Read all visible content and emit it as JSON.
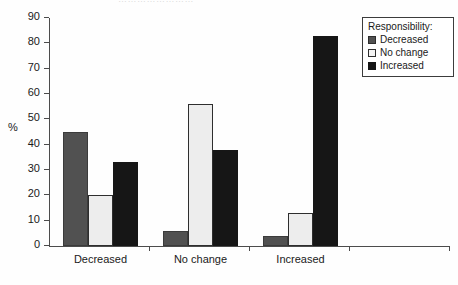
{
  "artifact": {
    "top_cut_text": "……………………"
  },
  "chart_data": {
    "type": "bar",
    "title": "",
    "xlabel": "",
    "ylabel": "%",
    "ylim": [
      0,
      90
    ],
    "ytick_values": [
      0,
      10,
      20,
      30,
      40,
      50,
      60,
      70,
      80,
      90
    ],
    "ytick_labels": [
      "0",
      "10",
      "20",
      "30",
      "40",
      "50",
      "60",
      "70",
      "80",
      "90"
    ],
    "grid": false,
    "legend_position": "top-right",
    "legend_title": "Responsibility:",
    "categories": [
      "Decreased",
      "No change",
      "Increased"
    ],
    "series": [
      {
        "name": "Decreased",
        "values": [
          45,
          6,
          4
        ]
      },
      {
        "name": "No change",
        "values": [
          20,
          56,
          13
        ]
      },
      {
        "name": "Increased",
        "values": [
          33,
          38,
          83
        ]
      }
    ]
  }
}
